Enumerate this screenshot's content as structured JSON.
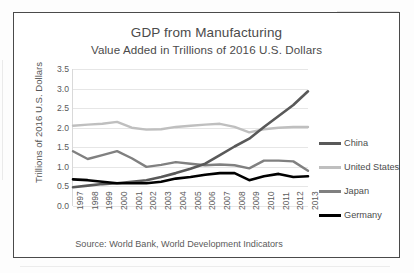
{
  "figure": {
    "title_line1": "GDP from Manufacturing",
    "title_line2": "Value Added in Trillions of 2016 U.S. Dollars",
    "source_note": "Source: World Bank, World Development Indicators"
  },
  "legend": {
    "position": "right",
    "entries": [
      {
        "label": "China",
        "color": "#595959"
      },
      {
        "label": "United States",
        "color": "#bfbfbf"
      },
      {
        "label": "Japan",
        "color": "#808080"
      },
      {
        "label": "Germany",
        "color": "#000000"
      }
    ]
  },
  "axes": {
    "y_title": "Trillions of 2016 U.S. Dollars",
    "y_ticks": [
      "0.0",
      "0.5",
      "1.0",
      "1.5",
      "2.0",
      "2.5",
      "3.0",
      "3.5"
    ],
    "x_ticks": [
      "1997",
      "1998",
      "1999",
      "2000",
      "2001",
      "2002",
      "2003",
      "2004",
      "2005",
      "2006",
      "2007",
      "2008",
      "2009",
      "2010",
      "2011",
      "2012",
      "2013"
    ]
  },
  "chart_data": {
    "type": "line",
    "xlabel": "",
    "ylabel": "Trillions of 2016 U.S. Dollars",
    "x": [
      1997,
      1998,
      1999,
      2000,
      2001,
      2002,
      2003,
      2004,
      2005,
      2006,
      2007,
      2008,
      2009,
      2010,
      2011,
      2012,
      2013
    ],
    "ylim": [
      0.0,
      3.5
    ],
    "ytick_step": 0.5,
    "grid": true,
    "legend_position": "right",
    "series": [
      {
        "name": "China",
        "color": "#595959",
        "values": [
          0.48,
          0.52,
          0.56,
          0.58,
          0.62,
          0.66,
          0.74,
          0.84,
          0.95,
          1.08,
          1.3,
          1.52,
          1.72,
          2.02,
          2.3,
          2.58,
          2.93
        ]
      },
      {
        "name": "United States",
        "color": "#bfbfbf",
        "values": [
          2.05,
          2.08,
          2.1,
          2.15,
          2.0,
          1.95,
          1.96,
          2.02,
          2.05,
          2.08,
          2.1,
          2.02,
          1.88,
          1.96,
          2.0,
          2.02,
          2.02
        ]
      },
      {
        "name": "Japan",
        "color": "#808080",
        "values": [
          1.4,
          1.2,
          1.3,
          1.4,
          1.22,
          1.0,
          1.05,
          1.12,
          1.08,
          1.04,
          1.06,
          1.04,
          0.96,
          1.16,
          1.16,
          1.14,
          0.9
        ]
      },
      {
        "name": "Germany",
        "color": "#000000",
        "values": [
          0.68,
          0.66,
          0.62,
          0.58,
          0.58,
          0.58,
          0.62,
          0.7,
          0.74,
          0.8,
          0.84,
          0.84,
          0.66,
          0.76,
          0.82,
          0.74,
          0.76
        ]
      }
    ]
  }
}
